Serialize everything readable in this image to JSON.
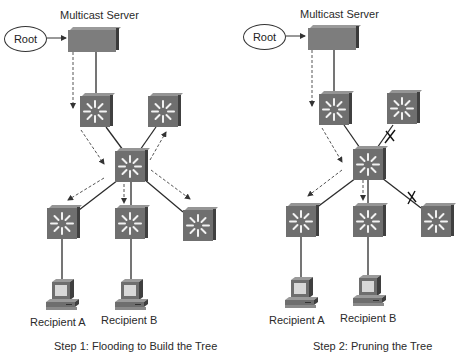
{
  "diagrams": [
    {
      "id": "step1",
      "server_label": "Multicast Server",
      "root_label": "Root",
      "recipients": [
        "Recipient A",
        "Recipient B"
      ],
      "caption": "Step 1: Flooding to Build the Tree",
      "flood_arrows": [
        "server-to-switch1",
        "switch1-to-core",
        "core-to-switch2",
        "core-to-bottom-left",
        "core-to-bottom-mid",
        "core-to-bottom-right"
      ],
      "pruned_links": []
    },
    {
      "id": "step2",
      "server_label": "Multicast Server",
      "root_label": "Root",
      "recipients": [
        "Recipient A",
        "Recipient B"
      ],
      "caption": "Step 2: Pruning the Tree",
      "flood_arrows": [
        "server-to-switch1",
        "switch1-to-core",
        "core-to-bottom-left",
        "core-to-bottom-mid"
      ],
      "pruned_links": [
        "core-to-switch2",
        "core-to-bottom-right"
      ],
      "prune_mark": "X"
    }
  ],
  "colors": {
    "device_face": "#6f6f6f",
    "device_top": "#959595",
    "device_side": "#404040",
    "link": "#2b2b2b",
    "flood_arrow": "#555555"
  }
}
